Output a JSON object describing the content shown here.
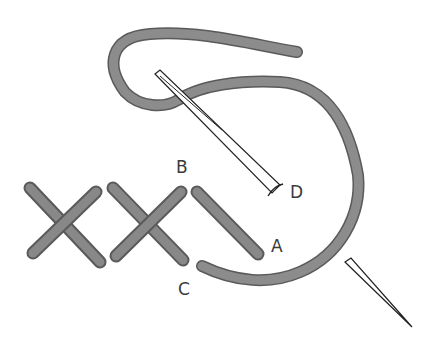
{
  "diagram": {
    "colors": {
      "thread_fill": "#8c8c8c",
      "thread_edge": "#5a5a5a",
      "needle_stroke": "#222222",
      "label": "#3a3a3a",
      "background": "#ffffff"
    },
    "labels": {
      "a": "A",
      "b": "B",
      "c": "C",
      "d": "D"
    },
    "elements": {
      "completed_crosses": 2,
      "half_stitch": 1,
      "needles": 2
    }
  }
}
